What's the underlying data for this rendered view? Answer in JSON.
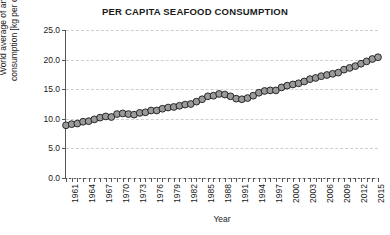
{
  "chart_data": {
    "type": "line",
    "title": "PER CAPITA SEAFOOD CONSUMPTION",
    "xlabel": "Year",
    "ylabel": "World average of annual\nconsumption [kg per capita]",
    "ylabel_line1": "World average of annual",
    "ylabel_line2": "consumption [kg per capita]",
    "grid": true,
    "grid_axis": "y",
    "legend": "none",
    "marker": "circle",
    "marker_facecolor": "#9a9a9a",
    "marker_edgecolor": "#1a1a1a",
    "line_color": "#1a1a1a",
    "xlim": [
      1961,
      2016
    ],
    "ylim": [
      0.0,
      25.0
    ],
    "yticks": [
      0.0,
      5.0,
      10.0,
      15.0,
      20.0,
      25.0
    ],
    "ytick_labels": [
      "0.0",
      "5.0",
      "10.0",
      "15.0",
      "20.0",
      "25.0"
    ],
    "xtick_labels": [
      "1961",
      "1964",
      "1967",
      "1970",
      "1973",
      "1976",
      "1979",
      "1982",
      "1985",
      "1988",
      "1991",
      "1994",
      "1997",
      "2000",
      "2003",
      "2006",
      "2009",
      "2012",
      "2015"
    ],
    "xtick_interval": 3,
    "x": [
      1961,
      1962,
      1963,
      1964,
      1965,
      1966,
      1967,
      1968,
      1969,
      1970,
      1971,
      1972,
      1973,
      1974,
      1975,
      1976,
      1977,
      1978,
      1979,
      1980,
      1981,
      1982,
      1983,
      1984,
      1985,
      1986,
      1987,
      1988,
      1989,
      1990,
      1991,
      1992,
      1993,
      1994,
      1995,
      1996,
      1997,
      1998,
      1999,
      2000,
      2001,
      2002,
      2003,
      2004,
      2005,
      2006,
      2007,
      2008,
      2009,
      2010,
      2011,
      2012,
      2013,
      2014,
      2015,
      2016
    ],
    "values": [
      8.9,
      9.1,
      9.2,
      9.5,
      9.6,
      9.9,
      10.2,
      10.4,
      10.3,
      10.8,
      10.9,
      10.8,
      10.7,
      11.0,
      11.1,
      11.4,
      11.4,
      11.7,
      11.9,
      12.0,
      12.2,
      12.4,
      12.5,
      12.9,
      13.3,
      13.8,
      13.9,
      14.2,
      14.1,
      13.8,
      13.4,
      13.3,
      13.5,
      13.9,
      14.4,
      14.7,
      14.8,
      14.8,
      15.3,
      15.6,
      15.8,
      16.0,
      16.3,
      16.7,
      16.9,
      17.2,
      17.4,
      17.6,
      17.8,
      18.3,
      18.6,
      18.9,
      19.3,
      19.7,
      20.1,
      20.4
    ]
  }
}
